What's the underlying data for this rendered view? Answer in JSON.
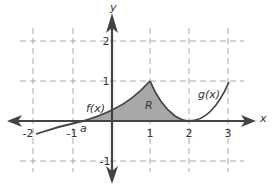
{
  "diagram": {
    "type": "coordinate-graph",
    "axes": {
      "x_label": "x",
      "y_label": "y",
      "x_ticks": [
        "-2",
        "-1",
        "1",
        "2",
        "3"
      ],
      "y_ticks": [
        "2",
        "1",
        "-1"
      ]
    },
    "curves": {
      "f_label": "f(x)",
      "g_label": "g(x)"
    },
    "region_label": "R",
    "point_label": "a",
    "colors": {
      "axis": "#444444",
      "grid": "#aaaaaa",
      "curve": "#444444",
      "region_fill": "#a8a8a8"
    }
  }
}
